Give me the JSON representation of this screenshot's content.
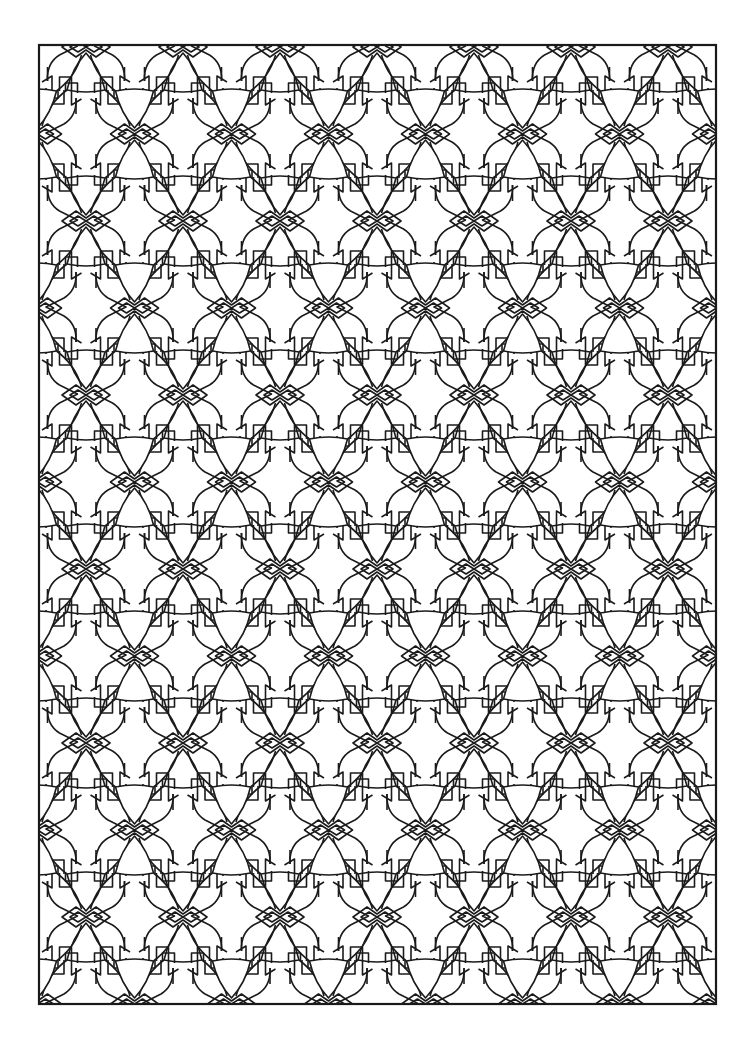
{
  "page": {
    "background": "#ffffff",
    "ink": "#1a1a1a",
    "frame": {
      "x": 39,
      "y": 45,
      "width": 677,
      "height": 959,
      "stroke_width": 2.2
    }
  },
  "pattern": {
    "name": "geometric-cross-and-trefoil-tessellation",
    "tile_width": 97,
    "tile_height": 174,
    "origin_x": 86,
    "origin_y": 134,
    "row_offset_x": 48.5,
    "row_offset_y": 87,
    "line_width": 1.6,
    "motifs": [
      "cross-flower",
      "up-curved-triangle",
      "down-curved-triangle",
      "double-outline-bowtie",
      "stepped-chevron"
    ]
  }
}
